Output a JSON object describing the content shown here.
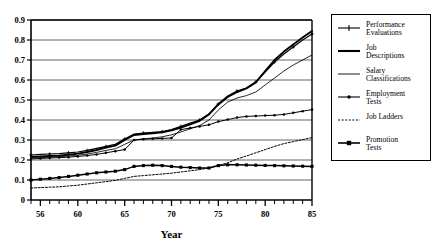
{
  "chart_data": {
    "type": "line",
    "title": "",
    "xlabel": "Year",
    "ylabel": "",
    "xlim": [
      55,
      85
    ],
    "ylim": [
      0,
      0.9
    ],
    "grid": true,
    "legend_position": "right-outside",
    "x_tick_labels": [
      "56",
      "60",
      "65",
      "70",
      "75",
      "80",
      "85"
    ],
    "x_tick_values": [
      56,
      60,
      65,
      70,
      75,
      80,
      85
    ],
    "x_minor_ticks_every": 1,
    "y_tick_labels": [
      "0",
      "0.1",
      "0.2",
      "0.3",
      "0.4",
      "0.5",
      "0.6",
      "0.7",
      "0.8",
      "0.9"
    ],
    "y_tick_values": [
      0,
      0.1,
      0.2,
      0.3,
      0.4,
      0.5,
      0.6,
      0.7,
      0.8,
      0.9
    ],
    "x": [
      55,
      56,
      57,
      58,
      59,
      60,
      61,
      62,
      63,
      64,
      65,
      66,
      67,
      68,
      69,
      70,
      71,
      72,
      73,
      74,
      75,
      76,
      77,
      78,
      79,
      80,
      81,
      82,
      83,
      84,
      85
    ],
    "series": [
      {
        "name": "Performance Evaluations",
        "style": "solid-plus",
        "values": [
          0.225,
          0.228,
          0.23,
          0.232,
          0.236,
          0.24,
          0.248,
          0.258,
          0.268,
          0.278,
          0.305,
          0.33,
          0.335,
          0.338,
          0.342,
          0.352,
          0.368,
          0.385,
          0.4,
          0.43,
          0.48,
          0.52,
          0.545,
          0.56,
          0.59,
          0.64,
          0.69,
          0.73,
          0.765,
          0.8,
          0.83
        ]
      },
      {
        "name": "Job Descriptions",
        "style": "solid-thick",
        "values": [
          0.215,
          0.218,
          0.22,
          0.222,
          0.226,
          0.232,
          0.24,
          0.25,
          0.262,
          0.272,
          0.3,
          0.325,
          0.33,
          0.334,
          0.338,
          0.348,
          0.362,
          0.378,
          0.396,
          0.428,
          0.478,
          0.515,
          0.54,
          0.558,
          0.588,
          0.645,
          0.7,
          0.742,
          0.778,
          0.812,
          0.845
        ]
      },
      {
        "name": "Salary Classifications",
        "style": "solid-thin",
        "values": [
          0.21,
          0.212,
          0.214,
          0.216,
          0.22,
          0.224,
          0.23,
          0.238,
          0.248,
          0.256,
          0.278,
          0.3,
          0.306,
          0.31,
          0.316,
          0.326,
          0.34,
          0.356,
          0.372,
          0.4,
          0.45,
          0.49,
          0.51,
          0.522,
          0.54,
          0.575,
          0.61,
          0.645,
          0.675,
          0.7,
          0.725
        ]
      },
      {
        "name": "Employment Tests",
        "style": "solid-dot",
        "values": [
          0.205,
          0.208,
          0.21,
          0.212,
          0.214,
          0.218,
          0.222,
          0.228,
          0.236,
          0.244,
          0.252,
          0.3,
          0.304,
          0.306,
          0.308,
          0.31,
          0.352,
          0.36,
          0.368,
          0.376,
          0.392,
          0.402,
          0.412,
          0.418,
          0.42,
          0.422,
          0.424,
          0.428,
          0.436,
          0.444,
          0.452
        ]
      },
      {
        "name": "Job Ladders",
        "style": "dashed",
        "values": [
          0.06,
          0.062,
          0.064,
          0.066,
          0.07,
          0.074,
          0.08,
          0.086,
          0.092,
          0.098,
          0.108,
          0.118,
          0.122,
          0.126,
          0.13,
          0.134,
          0.14,
          0.146,
          0.152,
          0.16,
          0.172,
          0.186,
          0.205,
          0.22,
          0.236,
          0.252,
          0.268,
          0.282,
          0.292,
          0.302,
          0.312
        ]
      },
      {
        "name": "Promotion Tests",
        "style": "solid-square",
        "values": [
          0.1,
          0.104,
          0.108,
          0.112,
          0.118,
          0.124,
          0.13,
          0.136,
          0.14,
          0.144,
          0.152,
          0.168,
          0.172,
          0.174,
          0.172,
          0.168,
          0.164,
          0.162,
          0.16,
          0.16,
          0.172,
          0.176,
          0.176,
          0.175,
          0.174,
          0.173,
          0.172,
          0.171,
          0.17,
          0.169,
          0.168
        ]
      }
    ]
  },
  "legend": {
    "items": [
      {
        "label_line1": "Performance",
        "label_line2": "Evaluations",
        "style": "solid-plus"
      },
      {
        "label_line1": "Job",
        "label_line2": "Descriptions",
        "style": "solid-thick"
      },
      {
        "label_line1": "Salary",
        "label_line2": "Classifications",
        "style": "solid-thin"
      },
      {
        "label_line1": "Employment",
        "label_line2": "Tests",
        "style": "solid-dot"
      },
      {
        "label_line1": "Job Ladders",
        "label_line2": "",
        "style": "dashed"
      },
      {
        "label_line1": "Promotion",
        "label_line2": "Tests",
        "style": "solid-square"
      }
    ]
  },
  "colors": {
    "line": "#000000",
    "grid": "#555555",
    "axis": "#000000",
    "background": "#ffffff"
  }
}
